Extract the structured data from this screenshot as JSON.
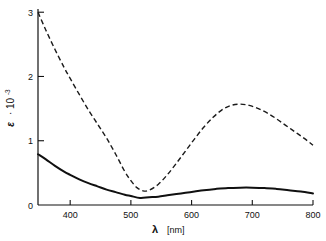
{
  "chart_data": {
    "type": "line",
    "title": "",
    "xlabel": "λ  [nm]",
    "xlabel_symbol": "λ",
    "xlabel_unit": "[nm]",
    "ylabel": "ε · 10⁻³",
    "ylabel_symbol": "ε",
    "ylabel_factor": "· 10",
    "ylabel_exponent": "-3",
    "xlim": [
      347,
      800
    ],
    "ylim": [
      0,
      3.05
    ],
    "grid": false,
    "legend": null,
    "xticks": [
      400,
      500,
      600,
      700,
      800
    ],
    "xticklabels": [
      "400",
      "500",
      "600",
      "700",
      "800"
    ],
    "yticks": [
      0,
      1,
      2,
      3
    ],
    "yticklabels": [
      "0",
      "1",
      "2",
      "3"
    ],
    "series": [
      {
        "name": "dashed-curve",
        "style": "dashed",
        "x": [
          347,
          360,
          375,
          390,
          400,
          415,
          430,
          445,
          460,
          475,
          490,
          500,
          510,
          520,
          530,
          545,
          560,
          575,
          590,
          605,
          620,
          635,
          650,
          665,
          680,
          695,
          710,
          725,
          740,
          755,
          770,
          785,
          800
        ],
        "y": [
          3.0,
          2.72,
          2.42,
          2.14,
          1.97,
          1.72,
          1.48,
          1.26,
          1.04,
          0.79,
          0.52,
          0.38,
          0.27,
          0.22,
          0.23,
          0.32,
          0.47,
          0.65,
          0.84,
          1.03,
          1.21,
          1.36,
          1.48,
          1.55,
          1.57,
          1.55,
          1.5,
          1.43,
          1.34,
          1.24,
          1.14,
          1.04,
          0.93
        ]
      },
      {
        "name": "solid-curve",
        "style": "solid",
        "x": [
          347,
          360,
          375,
          390,
          400,
          415,
          430,
          445,
          460,
          475,
          490,
          500,
          515,
          530,
          545,
          560,
          575,
          590,
          605,
          620,
          640,
          660,
          680,
          700,
          720,
          740,
          760,
          780,
          800
        ],
        "y": [
          0.79,
          0.71,
          0.61,
          0.52,
          0.47,
          0.4,
          0.34,
          0.29,
          0.24,
          0.2,
          0.16,
          0.14,
          0.11,
          0.12,
          0.13,
          0.15,
          0.17,
          0.19,
          0.21,
          0.23,
          0.25,
          0.265,
          0.27,
          0.27,
          0.265,
          0.25,
          0.23,
          0.21,
          0.18
        ]
      }
    ]
  },
  "figure": {
    "caption": ""
  }
}
